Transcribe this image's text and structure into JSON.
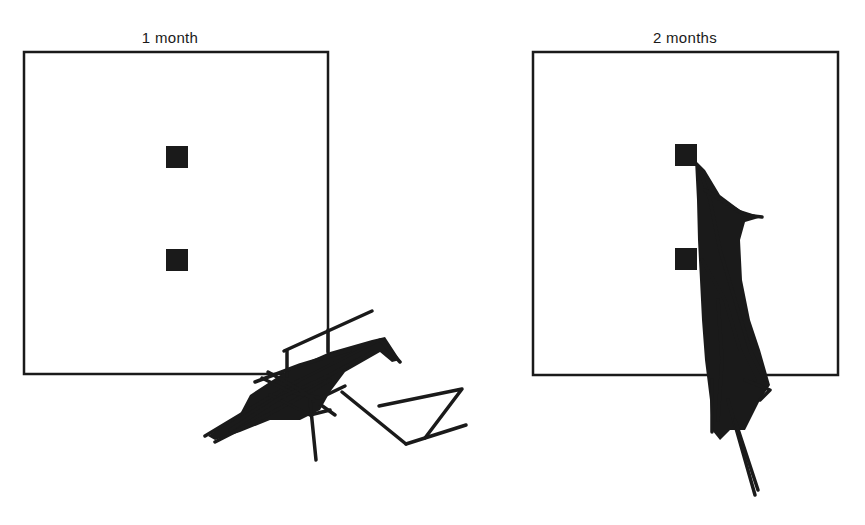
{
  "figure": {
    "width": 865,
    "height": 525,
    "ink_color": "#1a1a1a",
    "background": "#ffffff"
  },
  "panels": [
    {
      "label": "1 month",
      "label_pos": [
        170,
        39
      ],
      "box": {
        "x": 24,
        "y": 52,
        "w": 304,
        "h": 322
      },
      "targets": [
        {
          "x": 166,
          "y": 146,
          "size": 22
        },
        {
          "x": 166,
          "y": 249,
          "size": 22
        }
      ],
      "tangle_blobs": [
        [
          [
            250,
            395
          ],
          [
            285,
            372
          ],
          [
            330,
            352
          ],
          [
            372,
            340
          ],
          [
            385,
            337
          ],
          [
            400,
            360
          ],
          [
            392,
            362
          ],
          [
            380,
            352
          ],
          [
            345,
            372
          ],
          [
            330,
            392
          ],
          [
            320,
            410
          ],
          [
            300,
            420
          ],
          [
            270,
            420
          ],
          [
            240,
            432
          ],
          [
            215,
            440
          ],
          [
            208,
            436
          ],
          [
            240,
            414
          ]
        ]
      ],
      "paths": [
        [
          [
            284,
            351
          ],
          [
            372,
            311
          ]
        ],
        [
          [
            287,
            351
          ],
          [
            287,
            376
          ]
        ],
        [
          [
            328,
            330
          ],
          [
            328,
            352
          ]
        ],
        [
          [
            205,
            436
          ],
          [
            265,
            400
          ],
          [
            300,
            380
          ],
          [
            340,
            360
          ],
          [
            380,
            340
          ],
          [
            400,
            362
          ]
        ],
        [
          [
            215,
            442
          ],
          [
            258,
            420
          ],
          [
            295,
            400
          ],
          [
            330,
            380
          ]
        ],
        [
          [
            262,
            378
          ],
          [
            290,
            392
          ],
          [
            320,
            398
          ],
          [
            345,
            386
          ]
        ],
        [
          [
            310,
            400
          ],
          [
            316,
            460
          ]
        ],
        [
          [
            342,
            392
          ],
          [
            406,
            444
          ]
        ],
        [
          [
            379,
            406
          ],
          [
            462,
            389
          ],
          [
            425,
            438
          ]
        ],
        [
          [
            406,
            444
          ],
          [
            466,
            425
          ]
        ],
        [
          [
            270,
            395
          ],
          [
            310,
            415
          ],
          [
            330,
            410
          ]
        ],
        [
          [
            230,
            430
          ],
          [
            280,
            398
          ],
          [
            330,
            375
          ],
          [
            372,
            352
          ]
        ],
        [
          [
            255,
            382
          ],
          [
            300,
            365
          ],
          [
            350,
            350
          ]
        ],
        [
          [
            268,
            372
          ],
          [
            300,
            390
          ],
          [
            335,
            415
          ]
        ]
      ]
    },
    {
      "label": "2 months",
      "label_pos": [
        685,
        39
      ],
      "box": {
        "x": 533,
        "y": 52,
        "w": 305,
        "h": 323
      },
      "targets": [
        {
          "x": 675,
          "y": 144,
          "size": 22
        },
        {
          "x": 675,
          "y": 248,
          "size": 22
        }
      ],
      "tangle_blobs": [
        [
          [
            695,
            160
          ],
          [
            705,
            170
          ],
          [
            720,
            195
          ],
          [
            740,
            210
          ],
          [
            762,
            217
          ],
          [
            745,
            222
          ],
          [
            740,
            240
          ],
          [
            742,
            280
          ],
          [
            750,
            320
          ],
          [
            760,
            350
          ],
          [
            770,
            385
          ],
          [
            760,
            400
          ],
          [
            745,
            430
          ],
          [
            730,
            430
          ],
          [
            720,
            440
          ],
          [
            712,
            430
          ],
          [
            710,
            400
          ],
          [
            705,
            360
          ],
          [
            702,
            320
          ],
          [
            700,
            280
          ],
          [
            698,
            240
          ],
          [
            697,
            200
          ]
        ]
      ],
      "paths": [
        [
          [
            700,
            170
          ],
          [
            710,
            200
          ],
          [
            720,
            250
          ],
          [
            735,
            300
          ],
          [
            750,
            350
          ],
          [
            765,
            380
          ]
        ],
        [
          [
            712,
            380
          ],
          [
            712,
            432
          ]
        ],
        [
          [
            728,
            400
          ],
          [
            755,
            495
          ]
        ],
        [
          [
            735,
            420
          ],
          [
            758,
            490
          ]
        ],
        [
          [
            705,
            190
          ],
          [
            745,
            215
          ],
          [
            762,
            217
          ]
        ],
        [
          [
            702,
            260
          ],
          [
            725,
            300
          ],
          [
            740,
            350
          ],
          [
            755,
            380
          ]
        ],
        [
          [
            718,
            300
          ],
          [
            722,
            360
          ],
          [
            718,
            420
          ]
        ],
        [
          [
            745,
            380
          ],
          [
            770,
            390
          ],
          [
            760,
            400
          ]
        ]
      ]
    }
  ]
}
